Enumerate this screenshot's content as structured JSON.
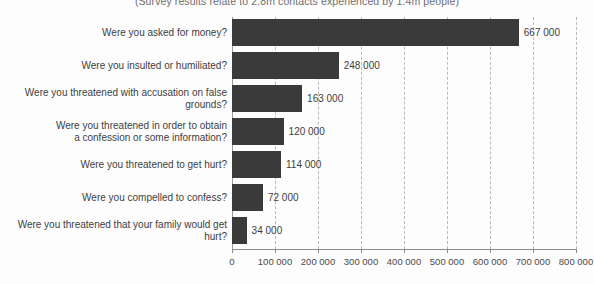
{
  "chart_data": {
    "type": "bar",
    "orientation": "horizontal",
    "title": "(Survey results relate to 2.8m contacts experienced by 1.4m people)",
    "xlabel": "",
    "ylabel": "",
    "xlim": [
      0,
      800000
    ],
    "grid": true,
    "legend": "none",
    "categories": [
      "Were you asked for money?",
      "Were you insulted or humiliated?",
      "Were you threatened with accusation on false grounds?",
      "Were you threatened in order to obtain\na confession or some information?",
      "Were you threatened to get hurt?",
      "Were you compelled to confess?",
      "Were you threatened that your family would get hurt?"
    ],
    "values": [
      667000,
      248000,
      163000,
      120000,
      114000,
      72000,
      34000
    ],
    "value_labels": [
      "667 000",
      "248 000",
      "163 000",
      "120 000",
      "114 000",
      "72 000",
      "34 000"
    ],
    "xticks": [
      0,
      100000,
      200000,
      300000,
      400000,
      500000,
      600000,
      700000,
      800000
    ],
    "xtick_labels": [
      "0",
      "100 000",
      "200 000",
      "300 000",
      "400 000",
      "500 000",
      "600 000",
      "700 000",
      "800 000"
    ],
    "bar_color": "#3a3a3a",
    "background_color": "#fdfdfd",
    "gridline_color": "#b9b9b9",
    "axis_color": "#8c8c8c"
  }
}
